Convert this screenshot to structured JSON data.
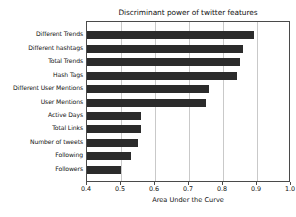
{
  "chart_data": {
    "type": "bar",
    "orientation": "horizontal",
    "title": "Discriminant power of twitter features",
    "xlabel": "Area Under the Curve",
    "ylabel": "",
    "xlim": [
      0.4,
      1.0
    ],
    "xticks": [
      0.4,
      0.5,
      0.6,
      0.7,
      0.8,
      0.9,
      1.0
    ],
    "xtick_labels": [
      "0.4",
      "0.5",
      "0.6",
      "0.7",
      "0.8",
      "0.9",
      "1.0"
    ],
    "grid": true,
    "grid_axis": "x",
    "legend": null,
    "bar_color": "#2b2b2b",
    "categories": [
      "Different Trends",
      "Different hashtags",
      "Total Trends",
      "Hash Tags",
      "Different User Mentions",
      "User Mentions",
      "Active Days",
      "Total Links",
      "Number of tweets",
      "Following",
      "Followers"
    ],
    "values": [
      0.89,
      0.86,
      0.85,
      0.84,
      0.76,
      0.75,
      0.56,
      0.56,
      0.55,
      0.53,
      0.5
    ]
  }
}
